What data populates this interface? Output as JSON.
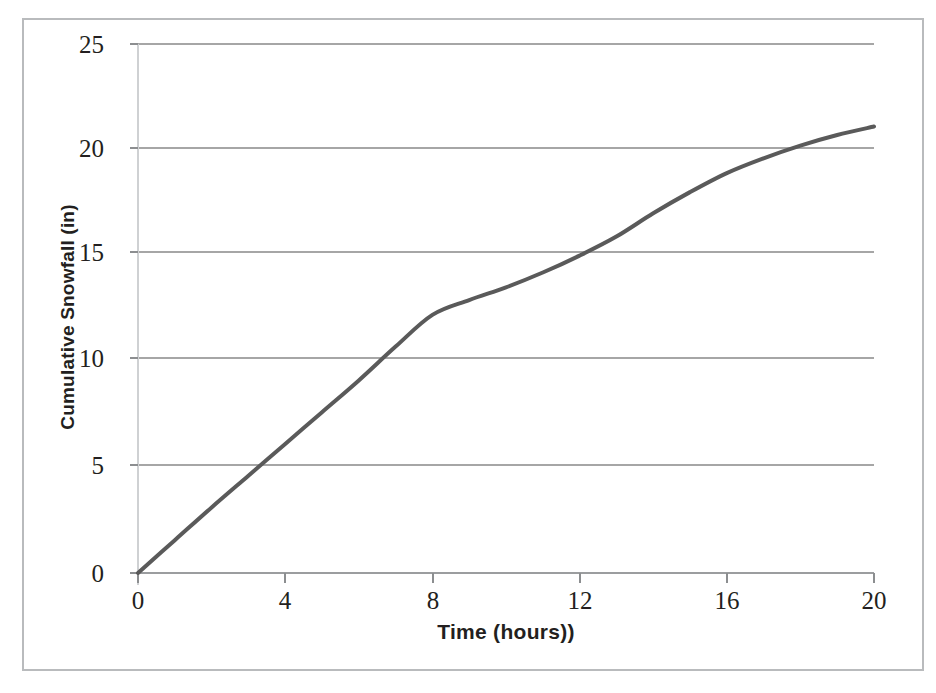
{
  "scan": {
    "artifact_text": "  ",
    "frame_color": "#b9bbbd"
  },
  "chart_data": {
    "type": "line",
    "title": "",
    "subtitle": "",
    "xlabel": "Time (hours))",
    "ylabel": "Cumulative Snowfall (in)",
    "xlim": [
      0,
      20
    ],
    "ylim": [
      0,
      25
    ],
    "xticks": [
      0,
      4,
      8,
      12,
      16,
      20
    ],
    "yticks": [
      0,
      5,
      10,
      15,
      20,
      25
    ],
    "xtick_labels": [
      "0",
      "4",
      "8",
      "12",
      "16",
      "20"
    ],
    "ytick_labels": [
      "0",
      "5",
      "10",
      "15",
      "20",
      "25"
    ],
    "grid": "horizontal",
    "grid_color": "#a6a6a6",
    "legend": "none",
    "series": [
      {
        "name": "Cumulative Snowfall",
        "color": "#5a5a5a",
        "line_width": 4,
        "marker": "none",
        "x": [
          0,
          1,
          2,
          3,
          4,
          5,
          6,
          7,
          8,
          9,
          10,
          11,
          12,
          13,
          14,
          15,
          16,
          17,
          18,
          19,
          20
        ],
        "values": [
          0.0,
          1.55,
          3.1,
          4.6,
          6.1,
          7.6,
          9.1,
          10.7,
          12.2,
          12.9,
          13.5,
          14.2,
          15.0,
          15.9,
          17.0,
          18.0,
          18.9,
          19.6,
          20.2,
          20.7,
          21.1
        ]
      }
    ]
  },
  "axes_geometry": {
    "plot_left_px": 138,
    "plot_right_px": 874,
    "plot_top_px": 44,
    "plot_bottom_px": 573
  }
}
